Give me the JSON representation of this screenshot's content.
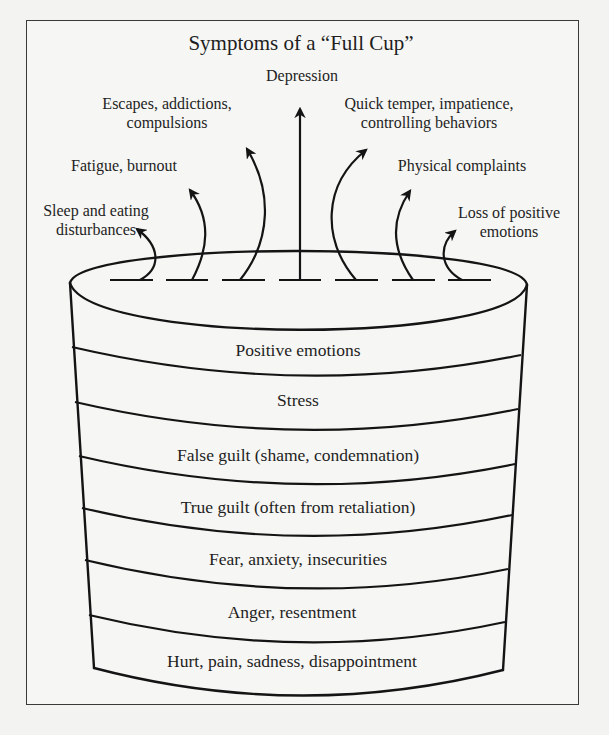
{
  "diagram": {
    "title": "Symptoms of a “Full Cup”",
    "symptoms": [
      {
        "id": "sleep",
        "line1": "Sleep and eating",
        "line2": "disturbances"
      },
      {
        "id": "fatigue",
        "line1": "Fatigue, burnout",
        "line2": ""
      },
      {
        "id": "escapes",
        "line1": "Escapes, addictions,",
        "line2": "compulsions"
      },
      {
        "id": "depression",
        "line1": "Depression",
        "line2": ""
      },
      {
        "id": "temper",
        "line1": "Quick temper, impatience,",
        "line2": "controlling behaviors"
      },
      {
        "id": "physical",
        "line1": "Physical complaints",
        "line2": ""
      },
      {
        "id": "loss",
        "line1": "Loss of positive",
        "line2": "emotions"
      }
    ],
    "cup_layers_top_to_bottom": [
      "Positive emotions",
      "Stress",
      "False guilt (shame, condemnation)",
      "True guilt (often from retaliation)",
      "Fear, anxiety, insecurities",
      "Anger, resentment",
      "Hurt, pain, sadness, disappointment"
    ],
    "colors": {
      "background": "#f3f3f1",
      "ink": "#1b1b1b",
      "frame": "#3a3a3a"
    }
  }
}
